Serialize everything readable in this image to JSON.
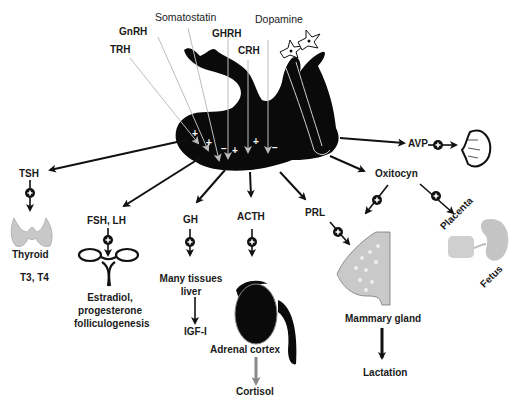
{
  "hypothalamic_hormones": [
    {
      "label": "TRH",
      "effect": "+"
    },
    {
      "label": "GnRH",
      "effect": "+"
    },
    {
      "label": "Somatostatin",
      "effect": "-"
    },
    {
      "label": "GHRH",
      "effect": "+"
    },
    {
      "label": "CRH",
      "effect": "+"
    },
    {
      "label": "Dopamine",
      "effect": "-"
    }
  ],
  "posterior_pituitary": {
    "avp": "AVP",
    "oxytocin": "Oxitocyn"
  },
  "anterior_outputs": {
    "tsh": {
      "hormone": "TSH",
      "target": "Thyroid",
      "product": "T3, T4"
    },
    "fsh_lh": {
      "hormone": "FSH, LH",
      "product_lines": [
        "Estradiol,",
        "progesterone",
        "folliculogenesis"
      ]
    },
    "gh": {
      "hormone": "GH",
      "target_lines": [
        "Many tissues",
        "liver"
      ],
      "product": "IGF-I"
    },
    "acth": {
      "hormone": "ACTH",
      "target": "Adrenal cortex",
      "product": "Cortisol"
    },
    "prl": {
      "hormone": "PRL"
    }
  },
  "targets": {
    "mammary": "Mammary gland",
    "lactation": "Lactation",
    "placenta": "Placenta",
    "fetus": "Fetus"
  },
  "symbols": {
    "plus": "+",
    "minus": "−"
  }
}
